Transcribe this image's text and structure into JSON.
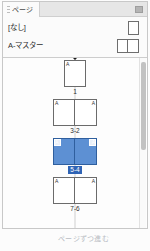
{
  "panel": {
    "tab_label": "ページ",
    "menu_icon": "panel-menu-icon",
    "grip_icon": "tab-grip-icon"
  },
  "masters": {
    "items": [
      {
        "label": "[なし]",
        "spread": 1
      },
      {
        "label": "A-マスター",
        "spread": 2
      }
    ]
  },
  "pages": {
    "spreads": [
      {
        "label": "1",
        "pages": [
          {
            "master": "A",
            "side": "single"
          }
        ],
        "selected": false,
        "current": true
      },
      {
        "label": "3-2",
        "pages": [
          {
            "master": "A",
            "side": "left"
          },
          {
            "master": "A",
            "side": "right"
          }
        ],
        "selected": false,
        "current": false
      },
      {
        "label": "5-4",
        "pages": [
          {
            "master": "A",
            "side": "left"
          },
          {
            "master": "A",
            "side": "right"
          }
        ],
        "selected": true,
        "current": false
      },
      {
        "label": "7-6",
        "pages": [
          {
            "master": "A",
            "side": "left"
          },
          {
            "master": "A",
            "side": "right"
          }
        ],
        "selected": false,
        "current": false
      }
    ]
  },
  "scrollbar": {
    "orientation": "vertical"
  },
  "caption": {
    "text": "ページずつ進む"
  },
  "colors": {
    "selection_blue": "#5d90d3",
    "selection_label_blue": "#2f64b5",
    "panel_bg": "#fbfbfb",
    "tabbar_bg": "#e6e6e6",
    "border": "#c8c8c8"
  }
}
